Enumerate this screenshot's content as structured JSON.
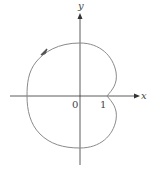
{
  "figure": {
    "type": "polar-curve",
    "axes": {
      "x_label": "x",
      "y_label": "y"
    },
    "ticks": {
      "origin": "0",
      "x_tick": "1"
    },
    "colors": {
      "curve": "#8a8a8a",
      "axis": "#333333"
    }
  }
}
